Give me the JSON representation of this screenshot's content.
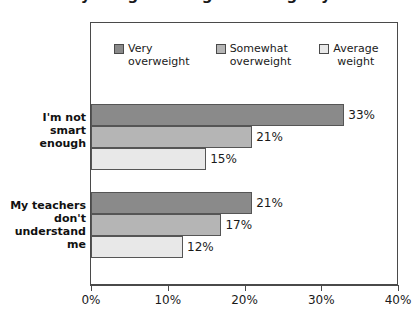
{
  "chart": {
    "title": "body image among overweight youth",
    "title_visible": "clipped"
  },
  "legend": {
    "position": "top-inside",
    "items": [
      {
        "label": "Very\noverweight",
        "color": "#8a8a8a"
      },
      {
        "label": "Somewhat\noverweight",
        "color": "#b5b5b5"
      },
      {
        "label": "Average\nweight",
        "color": "#e8e8e8"
      }
    ]
  },
  "axis": {
    "ticks": [
      "0%",
      "10%",
      "20%",
      "30%",
      "40%"
    ]
  },
  "categories": [
    {
      "label": "I'm not\nsmart\nenough"
    },
    {
      "label": "My teachers\ndon't\nunderstand\nme"
    }
  ],
  "bars": [
    {
      "value": 33,
      "label": "33%",
      "color": "#8a8a8a",
      "series": "Very overweight",
      "category": "I'm not smart enough"
    },
    {
      "value": 21,
      "label": "21%",
      "color": "#b5b5b5",
      "series": "Somewhat overweight",
      "category": "I'm not smart enough"
    },
    {
      "value": 15,
      "label": "15%",
      "color": "#e8e8e8",
      "series": "Average weight",
      "category": "I'm not smart enough"
    },
    {
      "value": 21,
      "label": "21%",
      "color": "#8a8a8a",
      "series": "Very overweight",
      "category": "My teachers don't understand me"
    },
    {
      "value": 17,
      "label": "17%",
      "color": "#b5b5b5",
      "series": "Somewhat overweight",
      "category": "My teachers don't understand me"
    },
    {
      "value": 12,
      "label": "12%",
      "color": "#e8e8e8",
      "series": "Average weight",
      "category": "My teachers don't understand me"
    }
  ],
  "chart_data": {
    "type": "bar",
    "orientation": "horizontal",
    "grouped": true,
    "title": "",
    "xlabel": "",
    "ylabel": "",
    "xlim": [
      0,
      40
    ],
    "xticks": [
      0,
      10,
      20,
      30,
      40
    ],
    "xtick_labels": [
      "0%",
      "10%",
      "20%",
      "30%",
      "40%"
    ],
    "grid": false,
    "legend_position": "top-inside",
    "categories": [
      "I'm not smart enough",
      "My teachers don't understand me"
    ],
    "series": [
      {
        "name": "Very overweight",
        "color": "#8a8a8a",
        "values": [
          33,
          21
        ],
        "value_labels": [
          "33%",
          "21%"
        ]
      },
      {
        "name": "Somewhat overweight",
        "color": "#b5b5b5",
        "values": [
          21,
          17
        ],
        "value_labels": [
          "21%",
          "17%"
        ]
      },
      {
        "name": "Average weight",
        "color": "#e8e8e8",
        "values": [
          15,
          12
        ],
        "value_labels": [
          "15%",
          "12%"
        ]
      }
    ],
    "units": "percent"
  }
}
